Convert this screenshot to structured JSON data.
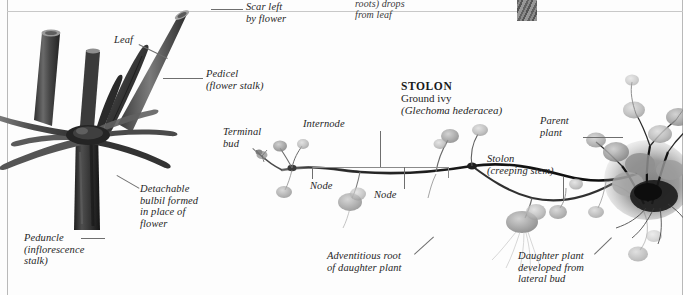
{
  "plate": {
    "background": "#fdfdfd",
    "ink": "#262626",
    "leader_color": "#6e6e6e"
  },
  "cut_off_top": {
    "left_fragment": "",
    "center_fragment": "roots) drops\nfrom leaf",
    "right_fragment": ""
  },
  "bulbil_figure": {
    "labels": {
      "scar": "Scar left\nby flower",
      "leaf": "Leaf",
      "pedicel": "Pedicel\n(flower stalk)",
      "bulbil": "Detachable\nbulbil formed\nin place of\nflower",
      "peduncle": "Peduncle\n(inflorescence\nstalk)"
    }
  },
  "stolon_figure": {
    "heading": {
      "title": "STOLON",
      "common_name": "Ground ivy",
      "latin_name": "(Glechoma hederacea)"
    },
    "labels": {
      "terminal_bud": "Terminal\nbud",
      "internode": "Internode",
      "node_left": "Node",
      "node_right": "Node",
      "stolon": "Stolon\n(creeping stem)",
      "parent_plant": "Parent\nplant",
      "adventitious_root": "Adventitious root\nof daughter plant",
      "daughter_plant": "Daughter plant\ndeveloped from\nlateral bud"
    }
  },
  "icons": {
    "thumbnail": "cropped-photo-thumbnail",
    "bulbil_plant": "bulbil-plant-illustration",
    "ground_ivy": "ground-ivy-stolon-illustration"
  }
}
